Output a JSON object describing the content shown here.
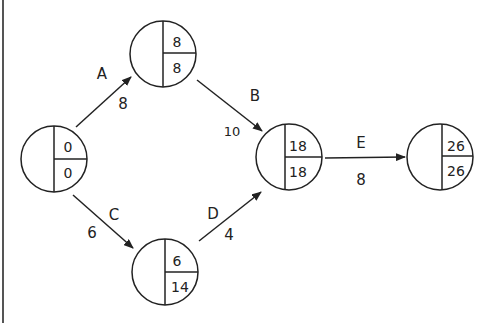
{
  "diagram": {
    "type": "activity-on-arrow network",
    "nodes": [
      {
        "id": "n1",
        "cx": 54,
        "cy": 159,
        "earliest": "0",
        "latest": "0"
      },
      {
        "id": "n2",
        "cx": 163,
        "cy": 54,
        "earliest": "8",
        "latest": "8"
      },
      {
        "id": "n3",
        "cx": 289,
        "cy": 157,
        "earliest": "18",
        "latest": "18"
      },
      {
        "id": "n4",
        "cx": 165,
        "cy": 272,
        "earliest": "6",
        "latest": "14"
      },
      {
        "id": "n5",
        "cx": 440,
        "cy": 157,
        "earliest": "26",
        "latest": "26"
      }
    ],
    "edges": [
      {
        "activity": "A",
        "duration": "8",
        "from": "n1",
        "to": "n2"
      },
      {
        "activity": "B",
        "duration": "10",
        "from": "n2",
        "to": "n3"
      },
      {
        "activity": "C",
        "duration": "6",
        "from": "n1",
        "to": "n4"
      },
      {
        "activity": "D",
        "duration": "4",
        "from": "n4",
        "to": "n3"
      },
      {
        "activity": "E",
        "duration": "8",
        "from": "n3",
        "to": "n5"
      }
    ]
  }
}
